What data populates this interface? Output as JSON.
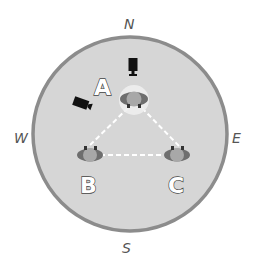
{
  "diagram": {
    "type": "stage-layout",
    "compass": {
      "north": "N",
      "south": "S",
      "east": "E",
      "west": "W"
    },
    "stage": {
      "fill": "#d6d6d6",
      "border": "#8c8c8c"
    },
    "people": [
      {
        "label": "A",
        "position": "top",
        "highlighted": true
      },
      {
        "label": "B",
        "position": "bottom-left",
        "highlighted": false
      },
      {
        "label": "C",
        "position": "bottom-right",
        "highlighted": false
      }
    ],
    "connections": [
      {
        "from": "A",
        "to": "B",
        "style": "dashed"
      },
      {
        "from": "B",
        "to": "C",
        "style": "dashed"
      },
      {
        "from": "C",
        "to": "A",
        "style": "dashed"
      }
    ],
    "cameras": [
      {
        "name": "camera-1",
        "position": "north of A",
        "facing": "south"
      },
      {
        "name": "camera-2",
        "position": "north-west of A",
        "facing": "south-east"
      }
    ]
  }
}
